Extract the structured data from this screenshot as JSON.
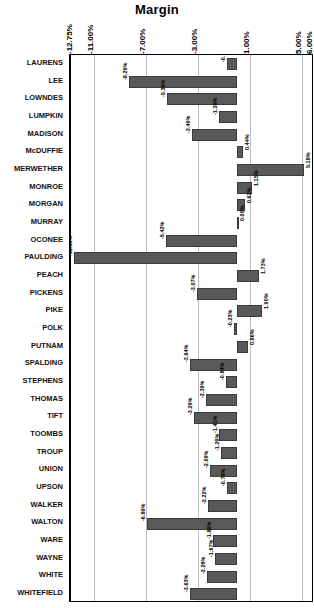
{
  "chart_data": {
    "type": "bar",
    "orientation": "horizontal",
    "title": "Margin",
    "xlabel": "",
    "ylabel": "",
    "xlim": [
      -12.75,
      6.0
    ],
    "grid": true,
    "legend": false,
    "value_suffix": "%",
    "xticks": [
      -12.75,
      -11.0,
      -7.0,
      -3.0,
      1.0,
      5.0,
      6.0
    ],
    "xtick_labels": [
      "-12.75%",
      "-11.00%",
      "-7.00%",
      "-3.00%",
      "1.00%",
      "5.00%",
      "6.00%"
    ],
    "categories": [
      "LAURENS",
      "LEE",
      "LOWNDES",
      "LUMPKIN",
      "MADISON",
      "McDUFFIE",
      "MERWETHER",
      "MONROE",
      "MORGAN",
      "MURRAY",
      "OCONEE",
      "PAULDING",
      "PEACH",
      "PICKENS",
      "PIKE",
      "POLK",
      "PUTNAM",
      "SPALDING",
      "STEPHENS",
      "THOMAS",
      "TIFT",
      "TOOMBS",
      "TROUP",
      "UNION",
      "UPSON",
      "WALKER",
      "WALTON",
      "WARE",
      "WAYNE",
      "WHITE",
      "WHITEFIELD"
    ],
    "values": [
      -0.73,
      -8.29,
      -5.38,
      -1.38,
      -3.49,
      0.44,
      5.18,
      1.15,
      0.62,
      0.09,
      -5.42,
      -12.5,
      1.73,
      -3.07,
      1.9,
      -0.23,
      0.86,
      -3.64,
      -0.84,
      -2.39,
      -3.29,
      -1.41,
      -1.2,
      -2.09,
      -0.78,
      -2.22,
      -6.89,
      -1.8,
      -1.67,
      -2.28,
      -3.63
    ],
    "data_labels": [
      "-0.73%",
      "-8.29%",
      "-5.38%",
      "-1.38%",
      "-3.49%",
      "0.44%",
      "5.18%",
      "1.15%",
      "0.62%",
      "0.09%",
      "-5.42%",
      "-12.50%",
      "1.73%",
      "-3.07%",
      "1.90%",
      "-0.23%",
      "0.86%",
      "-3.64%",
      "-0.84%",
      "-2.39%",
      "-3.29%",
      "-1.41%",
      "-1.20%",
      "-2.09%",
      "-0.78%",
      "-2.22%",
      "-6.89%",
      "-1.80%",
      "-1.67%",
      "-2.28%",
      "-3.63%"
    ],
    "bar_color": "#595959",
    "gridline_color": "#bdbdbd",
    "axis_color": "#000000"
  }
}
